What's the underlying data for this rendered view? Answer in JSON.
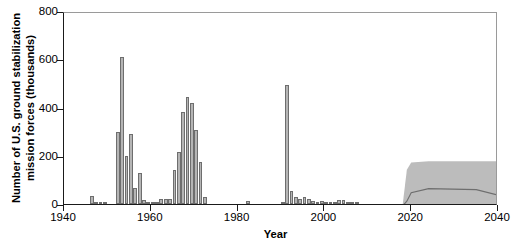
{
  "chart_data": {
    "type": "bar",
    "title": "",
    "subtitle": "",
    "xlabel": "Year",
    "ylabel": "Number of U.S. ground stabilization mission forces (thousands)",
    "ylabel_line1": "Number of U.S. ground stabilization",
    "ylabel_line2": "mission forces (thousands)",
    "xlim": [
      1940,
      2040
    ],
    "ylim": [
      0,
      800
    ],
    "grid": false,
    "legend": "none",
    "x_ticks": [
      1940,
      1960,
      1980,
      2000,
      2020,
      2040
    ],
    "x_tick_labels": [
      "1940",
      "1960",
      "1980",
      "2000",
      "2020",
      "2040"
    ],
    "y_ticks": [
      0,
      200,
      400,
      600,
      800
    ],
    "y_tick_labels": [
      "0",
      "200",
      "400",
      "600",
      "800"
    ],
    "bar_color": "#b5b5b5",
    "bar_edge_color": "#6e6e6e",
    "band_color": "#bcbcbc",
    "axis_color": "#1a1a1a",
    "categories": [
      1940,
      1941,
      1942,
      1943,
      1944,
      1945,
      1946,
      1947,
      1948,
      1949,
      1950,
      1951,
      1952,
      1953,
      1954,
      1955,
      1956,
      1957,
      1958,
      1959,
      1960,
      1961,
      1962,
      1963,
      1964,
      1965,
      1966,
      1967,
      1968,
      1969,
      1970,
      1971,
      1972,
      1973,
      1974,
      1975,
      1976,
      1977,
      1978,
      1979,
      1980,
      1981,
      1982,
      1983,
      1984,
      1985,
      1986,
      1987,
      1988,
      1989,
      1990,
      1991,
      1992,
      1993,
      1994,
      1995,
      1996,
      1997,
      1998,
      1999,
      2000,
      2001,
      2002,
      2003,
      2004,
      2005,
      2006,
      2007,
      2008,
      2009,
      2010,
      2011,
      2012,
      2013,
      2014,
      2015,
      2016,
      2017
    ],
    "values": [
      0,
      0,
      0,
      0,
      0,
      0,
      32,
      7,
      8,
      9,
      0,
      0,
      300,
      610,
      200,
      290,
      65,
      130,
      18,
      8,
      5,
      5,
      22,
      20,
      20,
      140,
      215,
      380,
      445,
      420,
      305,
      175,
      30,
      0,
      0,
      0,
      0,
      0,
      0,
      0,
      0,
      0,
      13,
      0,
      0,
      0,
      0,
      0,
      0,
      0,
      8,
      495,
      55,
      30,
      22,
      28,
      20,
      14,
      8,
      12,
      10,
      8,
      10,
      15,
      18,
      10,
      6,
      4,
      0,
      0,
      0,
      0,
      0,
      0,
      0,
      0,
      0,
      0
    ],
    "projection": {
      "label": "projected range",
      "start_year": 2018,
      "end_year": 2040,
      "upper_bound": 185,
      "lower_bound": 0,
      "median_start": 2019,
      "median_peak": 75,
      "median_end": 45,
      "ramp_years": [
        2018,
        2019,
        2020,
        2024,
        2035,
        2040
      ],
      "upper_values": [
        0,
        150,
        180,
        185,
        185,
        185
      ],
      "median_values": [
        0,
        20,
        55,
        72,
        68,
        45
      ]
    },
    "notable_events": [
      {
        "year": 1953,
        "value": 610,
        "note": "Korean War peak"
      },
      {
        "year": 1968,
        "value": 445,
        "note": "Vietnam War peak"
      },
      {
        "year": 1991,
        "value": 495,
        "note": "Gulf War peak"
      }
    ]
  }
}
